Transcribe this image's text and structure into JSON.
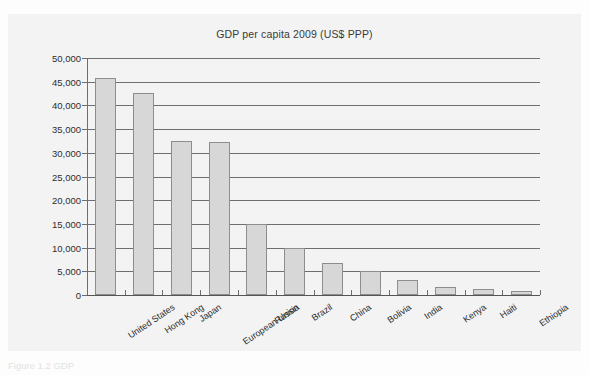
{
  "page": {
    "top_cut_text": "",
    "caption": "Figure 1.2 GDP"
  },
  "chart_data": {
    "type": "bar",
    "title": "GDP per capita 2009 (US$ PPP)",
    "xlabel": "",
    "ylabel": "",
    "ylim": [
      0,
      50000
    ],
    "grid": true,
    "legend": false,
    "ytick_labels": [
      "50,000",
      "45,000",
      "40,000",
      "35,000",
      "30,000",
      "25,000",
      "20,000",
      "15,000",
      "10,000",
      "5,000",
      "0"
    ],
    "ytick_values": [
      50000,
      45000,
      40000,
      35000,
      30000,
      25000,
      20000,
      15000,
      10000,
      5000,
      0
    ],
    "categories": [
      "United States",
      "Hong Kong",
      "Japan",
      "European Union",
      "Russia",
      "Brazil",
      "China",
      "Bolivia",
      "India",
      "Kenya",
      "Haiti",
      "Ethiopia"
    ],
    "values": [
      45800,
      42700,
      32500,
      32200,
      15000,
      10000,
      6700,
      5000,
      3200,
      1700,
      1200,
      900
    ],
    "bar_color": "#d7d7d7",
    "bar_border_color": "#8d8d8d",
    "grid_color": "#6e6e6e",
    "panel_color": "#f3f3f3"
  }
}
